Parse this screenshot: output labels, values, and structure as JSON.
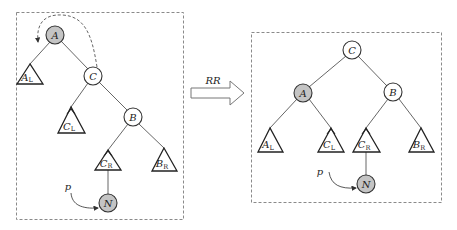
{
  "diagram": {
    "type": "AVL tree RR rotation",
    "transform_label": "RR",
    "pointer_label": "p",
    "highlight_color": "#c4c4c4",
    "before": {
      "nodes": [
        {
          "id": "A",
          "label": "A",
          "highlighted": true
        },
        {
          "id": "C",
          "label": "C",
          "highlighted": false
        },
        {
          "id": "B",
          "label": "B",
          "highlighted": false
        },
        {
          "id": "N",
          "label": "N",
          "highlighted": true
        }
      ],
      "subtrees": [
        {
          "id": "AL",
          "base": "A",
          "sub": "L"
        },
        {
          "id": "CL",
          "base": "C",
          "sub": "L"
        },
        {
          "id": "CR",
          "base": "C",
          "sub": "R"
        },
        {
          "id": "BR",
          "base": "B",
          "sub": "R"
        }
      ],
      "edges": [
        [
          "A",
          "AL"
        ],
        [
          "A",
          "C"
        ],
        [
          "C",
          "CL"
        ],
        [
          "C",
          "B"
        ],
        [
          "B",
          "CR"
        ],
        [
          "B",
          "BR"
        ],
        [
          "CR",
          "N"
        ]
      ]
    },
    "after": {
      "nodes": [
        {
          "id": "C",
          "label": "C",
          "highlighted": false
        },
        {
          "id": "A",
          "label": "A",
          "highlighted": true
        },
        {
          "id": "B",
          "label": "B",
          "highlighted": false
        },
        {
          "id": "N",
          "label": "N",
          "highlighted": true
        }
      ],
      "subtrees": [
        {
          "id": "AL",
          "base": "A",
          "sub": "L"
        },
        {
          "id": "CL",
          "base": "C",
          "sub": "L"
        },
        {
          "id": "CR",
          "base": "C",
          "sub": "R"
        },
        {
          "id": "BR",
          "base": "B",
          "sub": "R"
        }
      ],
      "edges": [
        [
          "C",
          "A"
        ],
        [
          "C",
          "B"
        ],
        [
          "A",
          "AL"
        ],
        [
          "A",
          "CL"
        ],
        [
          "B",
          "CR"
        ],
        [
          "B",
          "BR"
        ],
        [
          "CR",
          "N"
        ]
      ]
    }
  }
}
